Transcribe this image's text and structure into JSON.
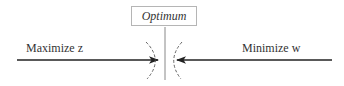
{
  "diagram": {
    "optimum_label": "Optimum",
    "left_label": "Maximize z",
    "right_label": "Minimize w"
  }
}
